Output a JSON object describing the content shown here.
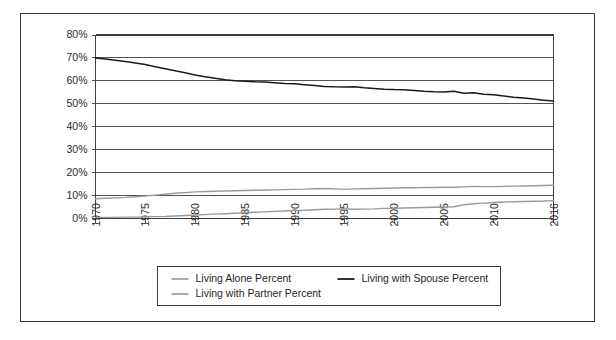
{
  "chart_data": {
    "type": "line",
    "title": "",
    "subtitle": "",
    "xlabel": "",
    "ylabel": "",
    "xlim": [
      1970,
      2016
    ],
    "ylim": [
      0,
      80
    ],
    "grid": true,
    "gridlines": "horizontal",
    "legend_position": "bottom",
    "y_ticks": [
      0,
      10,
      20,
      30,
      40,
      50,
      60,
      70,
      80
    ],
    "y_tick_labels": [
      "0%",
      "10%",
      "20%",
      "30%",
      "40%",
      "50%",
      "60%",
      "70%",
      "80%"
    ],
    "x_ticks": [
      1970,
      1975,
      1980,
      1985,
      1990,
      1995,
      2000,
      2005,
      2010,
      2016
    ],
    "x_tick_labels": [
      "1970",
      "1975",
      "1980",
      "1985",
      "1990",
      "1995",
      "2000",
      "2005",
      "2010",
      "2016"
    ],
    "x": [
      1970,
      1971,
      1972,
      1973,
      1974,
      1975,
      1976,
      1977,
      1978,
      1979,
      1980,
      1981,
      1982,
      1983,
      1984,
      1985,
      1986,
      1987,
      1988,
      1989,
      1990,
      1991,
      1992,
      1993,
      1994,
      1995,
      1996,
      1997,
      1998,
      1999,
      2000,
      2001,
      2002,
      2003,
      2004,
      2005,
      2006,
      2007,
      2008,
      2009,
      2010,
      2011,
      2012,
      2013,
      2014,
      2015,
      2016
    ],
    "series": [
      {
        "name": "Living Alone Percent",
        "color": "#9a9a9a",
        "values": [
          8.6,
          8.8,
          9.0,
          9.2,
          9.5,
          9.8,
          10.2,
          10.6,
          11.0,
          11.3,
          11.6,
          11.8,
          11.9,
          12.0,
          12.1,
          12.2,
          12.3,
          12.4,
          12.5,
          12.6,
          12.7,
          12.8,
          13.0,
          13.1,
          12.9,
          12.7,
          12.9,
          13.0,
          13.1,
          13.2,
          13.3,
          13.4,
          13.4,
          13.5,
          13.5,
          13.6,
          13.6,
          13.8,
          14.0,
          13.9,
          13.9,
          14.0,
          14.1,
          14.2,
          14.3,
          14.4,
          14.5
        ]
      },
      {
        "name": "Living with Spouse Percent",
        "color": "#1a1a1a",
        "values": [
          70.0,
          69.5,
          69.0,
          68.4,
          67.8,
          67.1,
          66.2,
          65.3,
          64.4,
          63.5,
          62.6,
          61.8,
          61.1,
          60.5,
          60.1,
          59.8,
          59.6,
          59.5,
          59.2,
          58.9,
          58.7,
          58.3,
          58.0,
          57.6,
          57.4,
          57.3,
          57.4,
          57.0,
          56.7,
          56.4,
          56.2,
          56.1,
          55.8,
          55.5,
          55.3,
          55.2,
          55.5,
          54.6,
          54.8,
          54.2,
          53.9,
          53.4,
          52.9,
          52.5,
          52.1,
          51.6,
          51.2
        ]
      },
      {
        "name": "Living with Partner Percent",
        "color": "#9a9a9a",
        "values": [
          0.5,
          0.5,
          0.5,
          0.6,
          0.6,
          0.7,
          0.8,
          0.9,
          1.1,
          1.3,
          1.5,
          1.7,
          1.9,
          2.1,
          2.3,
          2.5,
          2.7,
          2.9,
          3.1,
          3.3,
          3.5,
          3.6,
          3.8,
          4.0,
          4.1,
          4.2,
          4.0,
          4.1,
          4.2,
          4.4,
          4.5,
          4.6,
          4.7,
          4.8,
          4.9,
          5.0,
          5.1,
          6.0,
          6.4,
          6.7,
          7.0,
          7.2,
          7.3,
          7.4,
          7.5,
          7.6,
          7.8
        ]
      }
    ]
  },
  "legend": {
    "entries": [
      {
        "label": "Living Alone Percent",
        "color": "#9a9a9a"
      },
      {
        "label": "Living with Spouse Percent",
        "color": "#1a1a1a"
      },
      {
        "label": "Living with Partner Percent",
        "color": "#9a9a9a"
      }
    ]
  },
  "colors": {
    "frame": "#3a3a3a",
    "axis": "#3f3f3f",
    "grid": "#3f3f3f",
    "text": "#2b2b2b",
    "background": "#ffffff"
  }
}
